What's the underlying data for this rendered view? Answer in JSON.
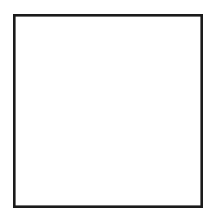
{
  "figure": {
    "kind": "distribution-range-map",
    "region_depicted": "United States (central and eastern portion, edges cropped by frame)",
    "projection_note": "conic, north up",
    "caption": "",
    "title": "",
    "legend": []
  },
  "colors": {
    "background": "#ffffff",
    "frame_border": "#1a1a1a",
    "state_boundary": "#4a4a4a",
    "coastline": "#111111",
    "shaded_range_dot": "#6e6e6e",
    "shaded_range_tint": "#d9d9d9"
  },
  "frame": {
    "x": 13,
    "y": 14,
    "width": 190,
    "height": 194,
    "stroke_width": 2.6
  },
  "shaded_range": {
    "label": "stippled distribution area",
    "pattern": "fine dot stipple",
    "description": "Great Plains band extending from the eastern Dakotas and eastern Montana south through Nebraska, Kansas, Oklahoma and the Texas panhandle",
    "states_covered": [
      "North Dakota",
      "South Dakota",
      "Nebraska",
      "Kansas",
      "Oklahoma",
      "eastern Montana",
      "eastern Wyoming",
      "eastern Colorado",
      "eastern New Mexico",
      "Texas panhandle"
    ],
    "extent_px": {
      "top": 40,
      "bottom": 166,
      "left": 58,
      "right": 134
    }
  },
  "map_features": {
    "great_lakes": [
      "Lake Superior",
      "Lake Michigan",
      "Lake Huron",
      "Lake Erie",
      "Lake Ontario"
    ],
    "notable_outlines": [
      "Gulf of Mexico coast",
      "Atlantic coast",
      "Pacific coast",
      "Texas",
      "Florida panhandle",
      "Michigan"
    ]
  }
}
